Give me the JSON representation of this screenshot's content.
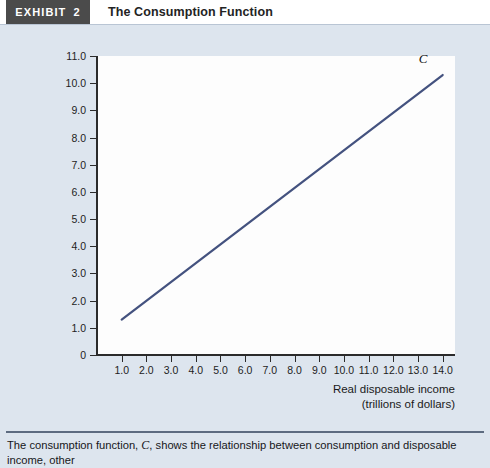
{
  "header": {
    "tag_label": "EXHIBIT",
    "tag_number": "2",
    "title": "The Consumption Function"
  },
  "caption": {
    "text_before": "The consumption function, ",
    "symbol": "C",
    "text_after": ", shows the relationship between consumption and disposable income, other"
  },
  "chart_data": {
    "type": "line",
    "title": "The Consumption Function",
    "xlabel": "Real disposable income",
    "xlabel_line2": "(trillions of dollars)",
    "ylabel": "Real consumption (trillions of dollars)",
    "xlim": [
      0,
      14.5
    ],
    "ylim": [
      0,
      11.0
    ],
    "grid": false,
    "legend": "none",
    "xticks": [
      "1.0",
      "2.0",
      "3.0",
      "4.0",
      "5.0",
      "6.0",
      "7.0",
      "8.0",
      "9.0",
      "10.0",
      "11.0",
      "12.0",
      "13.0",
      "14.0"
    ],
    "xtick_values": [
      1,
      2,
      3,
      4,
      5,
      6,
      7,
      8,
      9,
      10,
      11,
      12,
      13,
      14
    ],
    "yticks": [
      "0",
      "1.0",
      "2.0",
      "3.0",
      "4.0",
      "5.0",
      "6.0",
      "7.0",
      "8.0",
      "9.0",
      "10.0",
      "11.0"
    ],
    "ytick_values": [
      0,
      1,
      2,
      3,
      4,
      5,
      6,
      7,
      8,
      9,
      10,
      11
    ],
    "series": [
      {
        "name": "C",
        "annotation": "C",
        "color": "#44527f",
        "x": [
          1.0,
          14.0
        ],
        "y": [
          1.3,
          10.3
        ]
      }
    ]
  },
  "colors": {
    "page_background": "#dde5ee",
    "tag_background": "#4b4b4b",
    "plot_background": "#fdfdfd",
    "axis": "#2b2b2b",
    "curve": "#44527f",
    "rule": "#5d6b80"
  }
}
